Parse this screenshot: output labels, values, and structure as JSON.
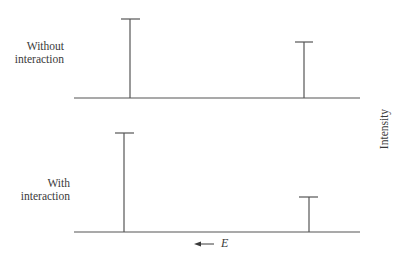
{
  "diagram": {
    "panels": [
      {
        "label_line1": "Without",
        "label_line2": "interaction",
        "peaks": [
          {
            "x": 130,
            "top": 19,
            "relative_intensity": 1.0
          },
          {
            "x": 304,
            "top": 42,
            "relative_intensity": 0.71
          }
        ],
        "baseline_y": 98
      },
      {
        "label_line1": "With",
        "label_line2": "interaction",
        "peaks": [
          {
            "x": 124,
            "top": 133,
            "relative_intensity": 1.0
          },
          {
            "x": 309,
            "top": 197,
            "relative_intensity": 0.35
          }
        ],
        "baseline_y": 232
      }
    ],
    "y_axis_label": "Intensity",
    "x_axis_label": "E",
    "x_axis_arrow": "←",
    "line_color": "#555555"
  }
}
